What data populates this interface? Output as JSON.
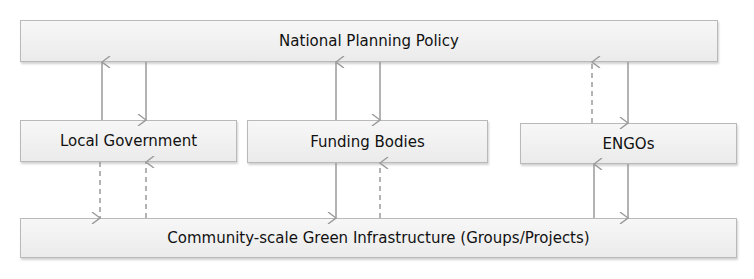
{
  "diagram": {
    "type": "flow",
    "nodes": [
      {
        "id": "national",
        "label": "National Planning Policy"
      },
      {
        "id": "local",
        "label": "Local Government"
      },
      {
        "id": "funding",
        "label": "Funding Bodies"
      },
      {
        "id": "engos",
        "label": "ENGOs"
      },
      {
        "id": "community",
        "label": "Community-scale Green Infrastructure (Groups/Projects)"
      }
    ],
    "edges": [
      {
        "from": "local",
        "to": "national",
        "style": "solid"
      },
      {
        "from": "national",
        "to": "local",
        "style": "solid"
      },
      {
        "from": "funding",
        "to": "national",
        "style": "solid"
      },
      {
        "from": "national",
        "to": "funding",
        "style": "solid"
      },
      {
        "from": "engos",
        "to": "national",
        "style": "dashed"
      },
      {
        "from": "national",
        "to": "engos",
        "style": "solid"
      },
      {
        "from": "local",
        "to": "community",
        "style": "dashed"
      },
      {
        "from": "community",
        "to": "local",
        "style": "dashed"
      },
      {
        "from": "funding",
        "to": "community",
        "style": "solid"
      },
      {
        "from": "community",
        "to": "funding",
        "style": "dashed"
      },
      {
        "from": "community",
        "to": "engos",
        "style": "solid"
      },
      {
        "from": "engos",
        "to": "community",
        "style": "solid"
      }
    ]
  },
  "colors": {
    "box_border": "#b9b9b9",
    "box_fill": "#efefef",
    "arrow": "#9a9a9a",
    "text": "#111111"
  }
}
